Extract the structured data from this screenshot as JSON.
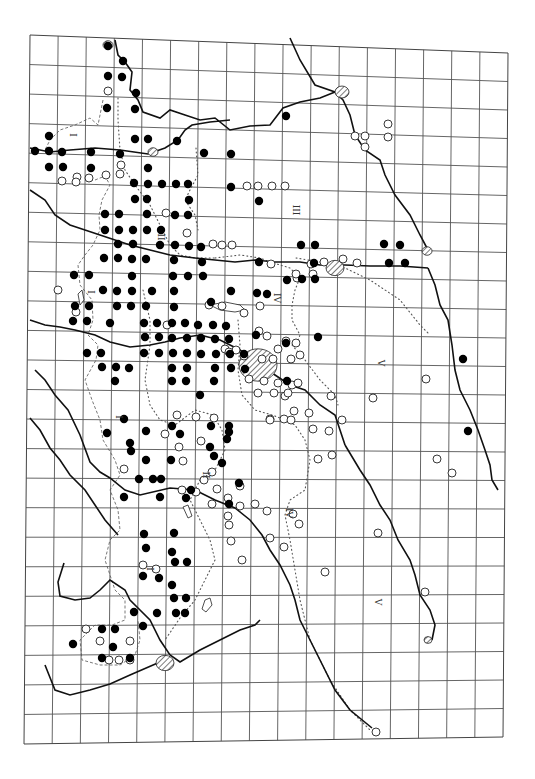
{
  "map": {
    "frame_corners": {
      "tl": [
        30,
        35
      ],
      "tr": [
        508,
        53
      ],
      "br": [
        503,
        737
      ],
      "bl": [
        24,
        744
      ]
    },
    "grid": {
      "cols": 17,
      "rows": 24
    },
    "colors": {
      "filled_dot": "#000000",
      "open_dot_stroke": "#222222",
      "grid": "#555555",
      "border": "#111111"
    },
    "zone_labels": [
      {
        "text": "I",
        "x": 72,
        "y": 135,
        "rot": 90
      },
      {
        "text": "II",
        "x": 160,
        "y": 237,
        "rot": 90
      },
      {
        "text": "III",
        "x": 295,
        "y": 210,
        "rot": 90
      },
      {
        "text": "I",
        "x": 90,
        "y": 292,
        "rot": 90
      },
      {
        "text": "IV",
        "x": 276,
        "y": 298,
        "rot": 90
      },
      {
        "text": "V",
        "x": 380,
        "y": 363,
        "rot": 90
      },
      {
        "text": "I",
        "x": 118,
        "y": 417,
        "rot": 90
      },
      {
        "text": "II",
        "x": 205,
        "y": 475,
        "rot": 90
      },
      {
        "text": "IV",
        "x": 288,
        "y": 513,
        "rot": 90
      },
      {
        "text": "I",
        "x": 149,
        "y": 569,
        "rot": 90
      },
      {
        "text": "V",
        "x": 377,
        "y": 602,
        "rot": 90
      }
    ],
    "filled_dots": [
      [
        108,
        46
      ],
      [
        123,
        61
      ],
      [
        108,
        76
      ],
      [
        122,
        77
      ],
      [
        136,
        93
      ],
      [
        107,
        108
      ],
      [
        135,
        109
      ],
      [
        49,
        136
      ],
      [
        135,
        139
      ],
      [
        148,
        139
      ],
      [
        177,
        141
      ],
      [
        35,
        151
      ],
      [
        49,
        151
      ],
      [
        62,
        152
      ],
      [
        91,
        152
      ],
      [
        120,
        154
      ],
      [
        204,
        153
      ],
      [
        231,
        154
      ],
      [
        286,
        116
      ],
      [
        49,
        167
      ],
      [
        63,
        167
      ],
      [
        91,
        168
      ],
      [
        148,
        168
      ],
      [
        231,
        187
      ],
      [
        259,
        201
      ],
      [
        134,
        183
      ],
      [
        148,
        184
      ],
      [
        162,
        184
      ],
      [
        176,
        184
      ],
      [
        188,
        184
      ],
      [
        135,
        199
      ],
      [
        147,
        199
      ],
      [
        189,
        200
      ],
      [
        105,
        214
      ],
      [
        119,
        214
      ],
      [
        147,
        214
      ],
      [
        175,
        215
      ],
      [
        188,
        215
      ],
      [
        105,
        230
      ],
      [
        119,
        230
      ],
      [
        133,
        230
      ],
      [
        147,
        230
      ],
      [
        161,
        230
      ],
      [
        118,
        244
      ],
      [
        133,
        244
      ],
      [
        160,
        245
      ],
      [
        175,
        245
      ],
      [
        189,
        246
      ],
      [
        201,
        247
      ],
      [
        301,
        245
      ],
      [
        315,
        245
      ],
      [
        384,
        244
      ],
      [
        400,
        245
      ],
      [
        104,
        258
      ],
      [
        118,
        258
      ],
      [
        132,
        259
      ],
      [
        146,
        259
      ],
      [
        174,
        260
      ],
      [
        202,
        262
      ],
      [
        259,
        262
      ],
      [
        314,
        263
      ],
      [
        389,
        263
      ],
      [
        405,
        263
      ],
      [
        74,
        275
      ],
      [
        89,
        275
      ],
      [
        132,
        276
      ],
      [
        173,
        276
      ],
      [
        188,
        276
      ],
      [
        203,
        276
      ],
      [
        302,
        279
      ],
      [
        315,
        279
      ],
      [
        287,
        280
      ],
      [
        103,
        290
      ],
      [
        117,
        291
      ],
      [
        132,
        291
      ],
      [
        152,
        291
      ],
      [
        174,
        291
      ],
      [
        231,
        291
      ],
      [
        257,
        293
      ],
      [
        267,
        294
      ],
      [
        75,
        306
      ],
      [
        89,
        306
      ],
      [
        117,
        306
      ],
      [
        131,
        306
      ],
      [
        146,
        306
      ],
      [
        174,
        307
      ],
      [
        211,
        302
      ],
      [
        73,
        321
      ],
      [
        87,
        321
      ],
      [
        110,
        323
      ],
      [
        144,
        323
      ],
      [
        157,
        323
      ],
      [
        172,
        323
      ],
      [
        185,
        323
      ],
      [
        198,
        325
      ],
      [
        213,
        325
      ],
      [
        226,
        326
      ],
      [
        256,
        335
      ],
      [
        318,
        337
      ],
      [
        145,
        337
      ],
      [
        159,
        337
      ],
      [
        172,
        338
      ],
      [
        187,
        338
      ],
      [
        201,
        338
      ],
      [
        215,
        339
      ],
      [
        229,
        339
      ],
      [
        286,
        343
      ],
      [
        87,
        353
      ],
      [
        101,
        353
      ],
      [
        144,
        353
      ],
      [
        159,
        353
      ],
      [
        173,
        353
      ],
      [
        187,
        353
      ],
      [
        201,
        354
      ],
      [
        216,
        354
      ],
      [
        230,
        354
      ],
      [
        244,
        354
      ],
      [
        102,
        367
      ],
      [
        116,
        367
      ],
      [
        129,
        368
      ],
      [
        172,
        368
      ],
      [
        187,
        368
      ],
      [
        215,
        368
      ],
      [
        231,
        368
      ],
      [
        245,
        369
      ],
      [
        115,
        381
      ],
      [
        172,
        381
      ],
      [
        186,
        381
      ],
      [
        214,
        381
      ],
      [
        287,
        381
      ],
      [
        463,
        359
      ],
      [
        200,
        395
      ],
      [
        124,
        419
      ],
      [
        172,
        426
      ],
      [
        211,
        426
      ],
      [
        229,
        426
      ],
      [
        107,
        433
      ],
      [
        146,
        431
      ],
      [
        180,
        434
      ],
      [
        229,
        432
      ],
      [
        210,
        447
      ],
      [
        227,
        439
      ],
      [
        130,
        443
      ],
      [
        131,
        451
      ],
      [
        146,
        460
      ],
      [
        171,
        460
      ],
      [
        222,
        463
      ],
      [
        161,
        479
      ],
      [
        139,
        479
      ],
      [
        153,
        479
      ],
      [
        214,
        456
      ],
      [
        239,
        483
      ],
      [
        191,
        490
      ],
      [
        468,
        431
      ],
      [
        172,
        552
      ],
      [
        229,
        504
      ],
      [
        124,
        497
      ],
      [
        160,
        497
      ],
      [
        144,
        534
      ],
      [
        174,
        533
      ],
      [
        186,
        498
      ],
      [
        146,
        548
      ],
      [
        143,
        576
      ],
      [
        175,
        562
      ],
      [
        187,
        562
      ],
      [
        159,
        578
      ],
      [
        172,
        585
      ],
      [
        174,
        598
      ],
      [
        186,
        598
      ],
      [
        134,
        612
      ],
      [
        157,
        613
      ],
      [
        176,
        613
      ],
      [
        185,
        613
      ],
      [
        102,
        629
      ],
      [
        115,
        629
      ],
      [
        143,
        626
      ],
      [
        113,
        647
      ],
      [
        73,
        644
      ],
      [
        102,
        658
      ],
      [
        130,
        658
      ]
    ],
    "open_dots": [
      [
        108,
        91
      ],
      [
        388,
        124
      ],
      [
        388,
        137
      ],
      [
        355,
        136
      ],
      [
        365,
        136
      ],
      [
        365,
        147
      ],
      [
        247,
        186
      ],
      [
        258,
        186
      ],
      [
        272,
        186
      ],
      [
        285,
        186
      ],
      [
        106,
        175
      ],
      [
        120,
        174
      ],
      [
        89,
        178
      ],
      [
        121,
        165
      ],
      [
        77,
        177
      ],
      [
        62,
        181
      ],
      [
        76,
        182
      ],
      [
        166,
        213
      ],
      [
        187,
        233
      ],
      [
        213,
        244
      ],
      [
        222,
        245
      ],
      [
        232,
        245
      ],
      [
        343,
        259
      ],
      [
        357,
        263
      ],
      [
        271,
        264
      ],
      [
        311,
        264
      ],
      [
        324,
        262
      ],
      [
        313,
        274
      ],
      [
        297,
        278
      ],
      [
        296,
        274
      ],
      [
        58,
        290
      ],
      [
        76,
        312
      ],
      [
        209,
        305
      ],
      [
        222,
        306
      ],
      [
        167,
        325
      ],
      [
        225,
        349
      ],
      [
        236,
        350
      ],
      [
        244,
        356
      ],
      [
        260,
        306
      ],
      [
        244,
        313
      ],
      [
        259,
        331
      ],
      [
        267,
        336
      ],
      [
        286,
        341
      ],
      [
        296,
        343
      ],
      [
        278,
        349
      ],
      [
        262,
        359
      ],
      [
        273,
        359
      ],
      [
        291,
        359
      ],
      [
        300,
        355
      ],
      [
        229,
        352
      ],
      [
        249,
        379
      ],
      [
        264,
        381
      ],
      [
        278,
        383
      ],
      [
        292,
        385
      ],
      [
        258,
        393
      ],
      [
        274,
        393
      ],
      [
        298,
        383
      ],
      [
        285,
        396
      ],
      [
        288,
        393
      ],
      [
        294,
        411
      ],
      [
        309,
        413
      ],
      [
        331,
        396
      ],
      [
        373,
        398
      ],
      [
        426,
        379
      ],
      [
        270,
        419
      ],
      [
        284,
        419
      ],
      [
        291,
        420
      ],
      [
        313,
        429
      ],
      [
        329,
        431
      ],
      [
        342,
        420
      ],
      [
        270,
        420
      ],
      [
        124,
        469
      ],
      [
        196,
        417
      ],
      [
        177,
        415
      ],
      [
        201,
        441
      ],
      [
        214,
        418
      ],
      [
        165,
        434
      ],
      [
        179,
        447
      ],
      [
        196,
        492
      ],
      [
        204,
        480
      ],
      [
        217,
        489
      ],
      [
        212,
        504
      ],
      [
        228,
        498
      ],
      [
        240,
        506
      ],
      [
        255,
        504
      ],
      [
        318,
        459
      ],
      [
        332,
        455
      ],
      [
        437,
        459
      ],
      [
        452,
        473
      ],
      [
        183,
        461
      ],
      [
        212,
        472
      ],
      [
        182,
        490
      ],
      [
        240,
        486
      ],
      [
        270,
        538
      ],
      [
        284,
        547
      ],
      [
        299,
        524
      ],
      [
        325,
        572
      ],
      [
        378,
        533
      ],
      [
        425,
        592
      ],
      [
        228,
        516
      ],
      [
        231,
        541
      ],
      [
        267,
        511
      ],
      [
        293,
        514
      ],
      [
        242,
        560
      ],
      [
        229,
        525
      ],
      [
        86,
        629
      ],
      [
        100,
        641
      ],
      [
        130,
        641
      ],
      [
        143,
        565
      ],
      [
        109,
        660
      ],
      [
        119,
        660
      ],
      [
        130,
        660
      ],
      [
        156,
        569
      ],
      [
        376,
        732
      ]
    ],
    "cities": [
      {
        "name": "city-north",
        "x": 108,
        "y": 45,
        "r": 5
      },
      {
        "name": "city-ne",
        "x": 342,
        "y": 92,
        "r": 7
      },
      {
        "name": "city-mid-north",
        "x": 153,
        "y": 152,
        "r": 5
      },
      {
        "name": "city-east-river",
        "x": 335,
        "y": 268,
        "r": 9
      },
      {
        "name": "city-east-edge",
        "x": 427,
        "y": 251,
        "r": 5
      },
      {
        "name": "capital",
        "x": 258,
        "y": 365,
        "r": 19
      },
      {
        "name": "city-south",
        "x": 165,
        "y": 663,
        "r": 9
      },
      {
        "name": "city-se",
        "x": 428,
        "y": 640,
        "r": 4
      }
    ]
  }
}
